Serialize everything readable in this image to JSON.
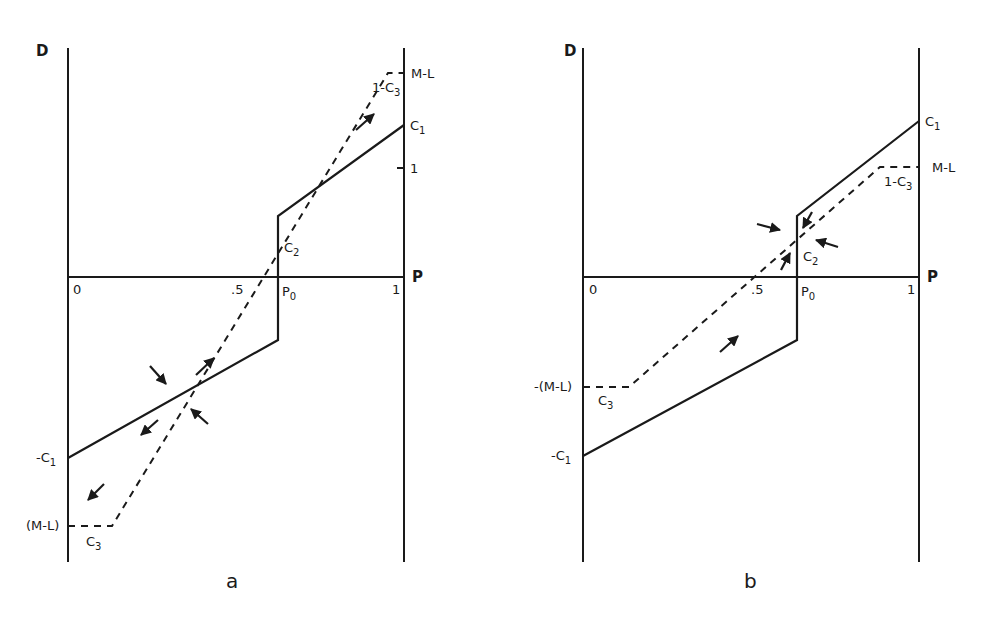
{
  "figure": {
    "panels": [
      {
        "id": "a",
        "caption": "a",
        "y_axis_label": "D",
        "x_axis_label": "P",
        "x_ticks": [
          "0",
          ".5",
          "P0",
          "1"
        ],
        "labels": {
          "c1": "C1",
          "neg_c1": "-C1",
          "one": "1",
          "ml": "M-L",
          "one_minus_c3": "1-C3",
          "c2": "C2",
          "neg_ml": "(M-L)",
          "c3": "C3",
          "p0": "P0"
        }
      },
      {
        "id": "b",
        "caption": "b",
        "y_axis_label": "D",
        "x_axis_label": "P",
        "x_ticks": [
          "0",
          ".5",
          "P0",
          "1"
        ],
        "labels": {
          "c1": "C1",
          "neg_c1": "-C1",
          "ml": "M-L",
          "one_minus_c3": "1-C3",
          "c2": "C2",
          "neg_ml": "-(M-L)",
          "c3": "C3",
          "p0": "P0"
        }
      }
    ]
  }
}
